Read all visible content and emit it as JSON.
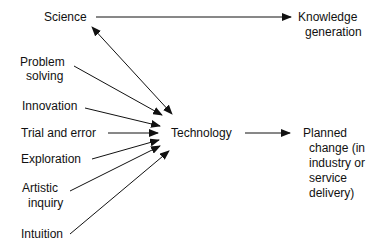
{
  "nodes": {
    "science": "Science",
    "knowledge_1": "Knowledge",
    "knowledge_2": "generation",
    "problem_1": "Problem",
    "problem_2": "solving",
    "innovation": "Innovation",
    "trial": "Trial and error",
    "exploration": "Exploration",
    "artistic_1": "Artistic",
    "artistic_2": "inquiry",
    "intuition": "Intuition",
    "technology": "Technology",
    "planned_1": "Planned",
    "planned_2": "change (in",
    "planned_3": "industry or",
    "planned_4": "service",
    "planned_5": "delivery)"
  },
  "edges": [
    {
      "from": "Science",
      "to": "Knowledge generation"
    },
    {
      "from": "Science",
      "to": "Technology",
      "bidirectional": true
    },
    {
      "from": "Problem solving",
      "to": "Technology"
    },
    {
      "from": "Innovation",
      "to": "Technology"
    },
    {
      "from": "Trial and error",
      "to": "Technology"
    },
    {
      "from": "Exploration",
      "to": "Technology"
    },
    {
      "from": "Artistic inquiry",
      "to": "Technology"
    },
    {
      "from": "Intuition",
      "to": "Technology"
    },
    {
      "from": "Technology",
      "to": "Planned change (in industry or service delivery)"
    }
  ]
}
